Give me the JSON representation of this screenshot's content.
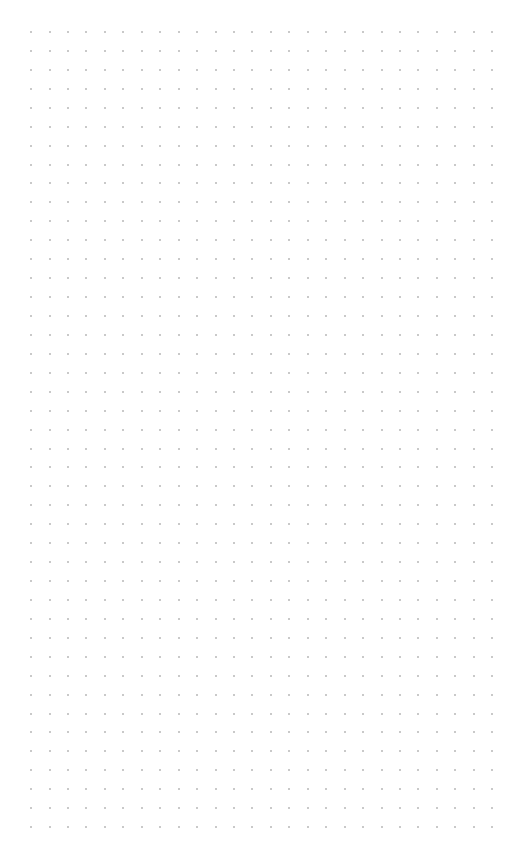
{
  "canvas": {
    "background": "#ffffff",
    "pattern": "dot-grid",
    "dot_color": "#a9a9a9",
    "columns": 26,
    "rows": 43,
    "origin_x": 31,
    "origin_y": 32,
    "spacing_x": 18.45,
    "spacing_y": 18.93
  }
}
